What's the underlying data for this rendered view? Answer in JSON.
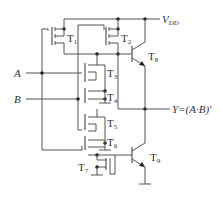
{
  "diagram": {
    "supply_label": "V",
    "supply_sub": "DD",
    "inputs": [
      {
        "name": "A"
      },
      {
        "name": "B"
      }
    ],
    "output": {
      "label": "Y=(A·B)′"
    },
    "transistors": [
      {
        "name": "T",
        "sub": "1"
      },
      {
        "name": "T",
        "sub": "2"
      },
      {
        "name": "T",
        "sub": "3"
      },
      {
        "name": "T",
        "sub": "4"
      },
      {
        "name": "T",
        "sub": "5"
      },
      {
        "name": "T",
        "sub": "6"
      },
      {
        "name": "T",
        "sub": "7"
      },
      {
        "name": "T",
        "sub": "8"
      },
      {
        "name": "T",
        "sub": "9"
      }
    ]
  }
}
